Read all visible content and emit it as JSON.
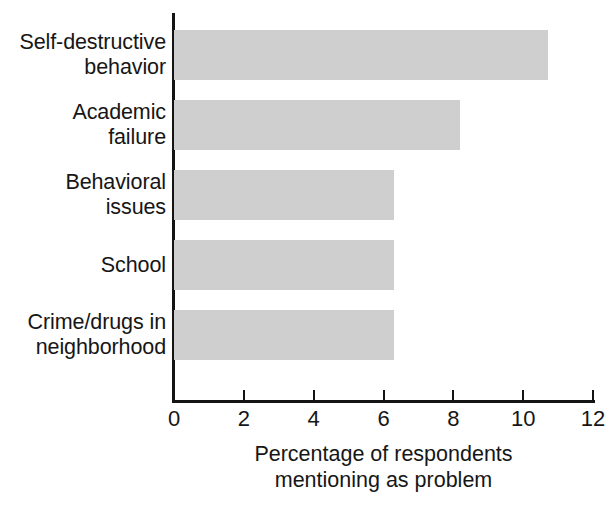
{
  "chart_data": {
    "type": "bar",
    "orientation": "horizontal",
    "title": "",
    "xlabel": "Percentage of respondents\nmentioning as problem",
    "ylabel": "",
    "xlim": [
      0,
      12
    ],
    "grid": false,
    "legend": false,
    "categories": [
      "Self-destructive\nbehavior",
      "Academic\nfailure",
      "Behavioral\nissues",
      "School",
      "Crime/drugs in\nneighborhood"
    ],
    "values": [
      10.7,
      8.2,
      6.3,
      6.3,
      6.3
    ],
    "xticks": [
      0,
      2,
      4,
      6,
      8,
      10,
      12
    ],
    "xticklabels": [
      "0",
      "2",
      "4",
      "6",
      "8",
      "10",
      "12"
    ],
    "bar_color": "#cfcfcf",
    "axis_color": "#141414",
    "text_color": "#161616",
    "background_color": "#ffffff"
  },
  "axis_title": {
    "line1": "Percentage of respondents",
    "line2": "mentioning as problem"
  }
}
